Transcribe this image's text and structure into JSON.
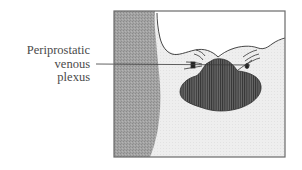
{
  "diagram": {
    "type": "anatomical-illustration",
    "label": {
      "lines": [
        "Periprostatic",
        "venous",
        "plexus"
      ],
      "text": "Periprostatic venous plexus"
    },
    "colors": {
      "frame": "#6a6a6a",
      "left_band": "#9e9e9e",
      "background_tissue": "#ededed",
      "upper_space": "#ffffff",
      "prostate_fill": "#5a5a5a",
      "prostate_stripes": "#3a3a3a",
      "leader_line": "#333333",
      "text": "#4a4a4a"
    },
    "structures": [
      {
        "id": "frame",
        "description": "rectangular border of section"
      },
      {
        "id": "left-band",
        "description": "gray shaded band along left edge"
      },
      {
        "id": "upper-space",
        "description": "white space above wavy boundary line"
      },
      {
        "id": "prostate",
        "description": "dark vertically striped lobular mass"
      },
      {
        "id": "venous-plexus-left",
        "description": "small vessel marks left of prostate"
      },
      {
        "id": "venous-plexus-right",
        "description": "small vessel marks right of prostate"
      }
    ]
  }
}
